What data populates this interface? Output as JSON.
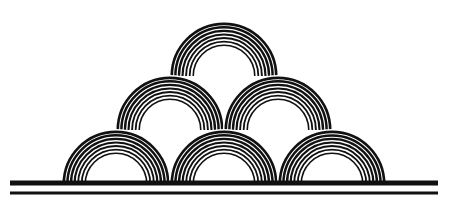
{
  "figure": {
    "colors": {
      "ink": "#111111",
      "background": "#ffffff"
    },
    "arch": {
      "outer_radius": 54,
      "inner_radius": 29,
      "rings": 7
    },
    "arches": [
      {
        "row": "bottom",
        "cx": 116,
        "cy": 184
      },
      {
        "row": "bottom",
        "cx": 224,
        "cy": 184
      },
      {
        "row": "bottom",
        "cx": 332,
        "cy": 184
      },
      {
        "row": "middle",
        "cx": 170,
        "cy": 130
      },
      {
        "row": "middle",
        "cx": 278,
        "cy": 130
      },
      {
        "row": "top",
        "cx": 224,
        "cy": 76
      }
    ],
    "ground_lines": [
      {
        "x1": 10,
        "x2": 438,
        "y": 183,
        "thickness": 5
      },
      {
        "x1": 10,
        "x2": 438,
        "y": 193,
        "thickness": 3
      }
    ]
  }
}
